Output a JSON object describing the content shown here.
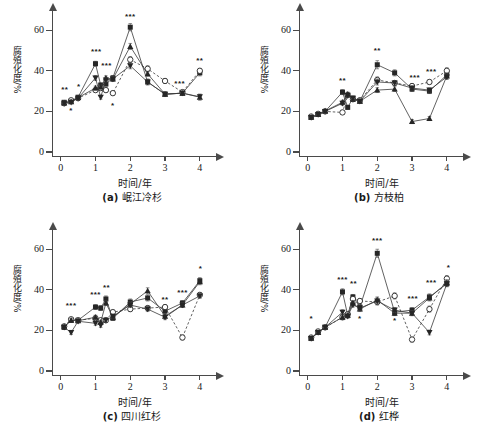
{
  "figure": {
    "panel_count": 4,
    "axis_color": "#4a4a4a"
  },
  "chart_data": [
    {
      "type": "line",
      "panel_id": "(a)",
      "title": "(a) 岷江冷杉",
      "caption_id": "(a)",
      "caption_text": "岷江冷杉",
      "xlabel": "时间/年",
      "ylabel": "腐殖化度/%",
      "xlim": [
        -0.25,
        4.35
      ],
      "ylim": [
        0,
        68
      ],
      "xticks": [
        0,
        1,
        2,
        3,
        4
      ],
      "yticks": [
        0,
        20,
        40,
        60
      ],
      "grid": false,
      "legend_position": "none",
      "x": [
        0.1,
        0.3,
        0.5,
        1.0,
        1.15,
        1.3,
        1.5,
        2.0,
        2.5,
        3.0,
        3.5,
        4.0
      ],
      "series": [
        {
          "name": "filled-square",
          "marker": "square-filled",
          "line": "solid",
          "values": [
            24.5,
            25.0,
            27.0,
            43.5,
            33.0,
            33.5,
            36.5,
            61.5,
            34.5,
            28.5,
            29.0,
            39.0
          ],
          "errors": [
            0.8,
            0.8,
            0.8,
            1.2,
            1.0,
            1.0,
            1.2,
            1.8,
            1.5,
            1.0,
            1.0,
            1.5
          ]
        },
        {
          "name": "open-circle",
          "marker": "circle-open",
          "line": "dashed",
          "values": [
            24.0,
            25.5,
            26.5,
            30.5,
            31.5,
            30.5,
            29.0,
            45.5,
            41.0,
            35.0,
            29.5,
            40.0
          ],
          "errors": [
            0.8,
            0.8,
            0.8,
            1.0,
            1.0,
            1.0,
            1.0,
            1.5,
            1.5,
            1.2,
            1.0,
            1.2
          ]
        },
        {
          "name": "filled-triangle-up",
          "marker": "triangle-filled",
          "line": "solid",
          "values": [
            24.2,
            24.8,
            26.8,
            31.5,
            32.0,
            36.5,
            36.0,
            52.0,
            38.5,
            28.5,
            29.0,
            27.0
          ],
          "errors": [
            0.8,
            0.8,
            0.8,
            1.0,
            1.0,
            1.0,
            1.2,
            1.5,
            1.2,
            1.0,
            1.0,
            1.5
          ]
        },
        {
          "name": "filled-triangle-down",
          "marker": "triangle-down-filled",
          "line": "solid",
          "values": [
            24.0,
            24.5,
            26.5,
            36.5,
            27.0,
            35.5,
            36.0,
            42.5,
            34.5,
            28.5,
            29.0,
            27.2
          ],
          "errors": [
            0.8,
            0.8,
            0.8,
            1.2,
            1.0,
            1.0,
            1.2,
            1.5,
            1.2,
            1.0,
            1.0,
            1.2
          ]
        }
      ],
      "annotations": [
        {
          "text": "**",
          "x": 0.12,
          "y": 30.5
        },
        {
          "text": "*",
          "x": 0.3,
          "y": 20.0
        },
        {
          "text": "*",
          "x": 0.52,
          "y": 32.0
        },
        {
          "text": "***",
          "x": 1.02,
          "y": 49.5
        },
        {
          "text": "***",
          "x": 1.32,
          "y": 42.5
        },
        {
          "text": "*",
          "x": 1.5,
          "y": 22.5
        },
        {
          "text": "***",
          "x": 2.0,
          "y": 66.5
        },
        {
          "text": "***",
          "x": 3.42,
          "y": 33.5
        },
        {
          "text": "**",
          "x": 4.0,
          "y": 45.0
        }
      ]
    },
    {
      "type": "line",
      "panel_id": "(b)",
      "title": "(b) 方枝柏",
      "caption_id": "(b)",
      "caption_text": "方枝柏",
      "xlabel": "时间/年",
      "ylabel": "腐殖化度/%",
      "xlim": [
        -0.25,
        4.35
      ],
      "ylim": [
        0,
        68
      ],
      "xticks": [
        0,
        1,
        2,
        3,
        4
      ],
      "yticks": [
        0,
        20,
        40,
        60
      ],
      "grid": false,
      "legend_position": "none",
      "x": [
        0.1,
        0.3,
        0.5,
        1.0,
        1.15,
        1.3,
        1.5,
        2.0,
        2.5,
        3.0,
        3.5,
        4.0
      ],
      "series": [
        {
          "name": "filled-square",
          "marker": "square-filled",
          "line": "solid",
          "values": [
            17.0,
            18.5,
            20.0,
            29.5,
            22.0,
            26.5,
            25.0,
            43.0,
            39.0,
            31.0,
            30.0,
            38.0
          ],
          "errors": [
            0.8,
            0.8,
            0.8,
            1.2,
            1.0,
            1.0,
            1.0,
            2.0,
            1.5,
            1.2,
            1.2,
            1.5
          ]
        },
        {
          "name": "open-circle",
          "marker": "circle-open",
          "line": "dashed",
          "values": [
            17.5,
            18.8,
            20.0,
            19.5,
            28.0,
            26.0,
            25.5,
            35.5,
            34.0,
            32.5,
            34.5,
            40.0
          ],
          "errors": [
            0.8,
            0.8,
            0.8,
            1.0,
            1.0,
            1.0,
            1.0,
            1.5,
            1.2,
            1.2,
            1.2,
            1.5
          ]
        },
        {
          "name": "filled-triangle-up",
          "marker": "triangle-filled",
          "line": "solid",
          "values": [
            17.2,
            18.5,
            20.2,
            24.5,
            28.5,
            26.0,
            25.0,
            30.5,
            31.0,
            15.0,
            16.5,
            37.5
          ],
          "errors": [
            0.8,
            0.8,
            0.8,
            1.0,
            1.0,
            1.0,
            1.0,
            1.2,
            1.2,
            1.0,
            1.0,
            1.5
          ]
        },
        {
          "name": "filled-triangle-down",
          "marker": "triangle-down-filled",
          "line": "solid",
          "values": [
            17.0,
            18.5,
            20.0,
            24.0,
            28.0,
            26.5,
            25.0,
            34.5,
            34.0,
            31.5,
            30.5,
            37.0
          ],
          "errors": [
            0.8,
            0.8,
            0.8,
            1.0,
            1.0,
            1.0,
            1.0,
            1.5,
            1.2,
            1.0,
            1.0,
            1.2
          ]
        }
      ],
      "annotations": [
        {
          "text": "**",
          "x": 1.0,
          "y": 35.0
        },
        {
          "text": "**",
          "x": 2.0,
          "y": 50.0
        },
        {
          "text": "***",
          "x": 3.08,
          "y": 36.5
        },
        {
          "text": "***",
          "x": 3.55,
          "y": 39.5
        }
      ]
    },
    {
      "type": "line",
      "panel_id": "(c)",
      "title": "(c) 四川红杉",
      "caption_id": "(c)",
      "caption_text": "四川红杉",
      "xlabel": "时间/年",
      "ylabel": "腐殖化度/%",
      "xlim": [
        -0.25,
        4.35
      ],
      "ylim": [
        0,
        68
      ],
      "xticks": [
        0,
        1,
        2,
        3,
        4
      ],
      "yticks": [
        0,
        20,
        40,
        60
      ],
      "grid": false,
      "legend_position": "none",
      "x": [
        0.1,
        0.3,
        0.5,
        1.0,
        1.15,
        1.3,
        1.5,
        2.0,
        2.5,
        3.0,
        3.5,
        4.0
      ],
      "series": [
        {
          "name": "filled-square",
          "marker": "square-filled",
          "line": "solid",
          "values": [
            21.5,
            25.0,
            25.0,
            31.5,
            31.0,
            35.5,
            26.0,
            34.0,
            36.0,
            29.5,
            33.5,
            44.5
          ],
          "errors": [
            0.8,
            0.8,
            0.8,
            1.2,
            1.2,
            1.5,
            1.0,
            1.5,
            1.5,
            1.5,
            1.2,
            1.5
          ]
        },
        {
          "name": "open-circle",
          "marker": "circle-open",
          "line": "dashed",
          "values": [
            22.0,
            25.5,
            25.0,
            26.0,
            25.0,
            25.0,
            29.0,
            30.5,
            31.0,
            31.5,
            16.5,
            37.5
          ],
          "errors": [
            0.8,
            0.8,
            0.8,
            1.0,
            1.0,
            1.0,
            1.0,
            1.2,
            1.2,
            1.2,
            1.2,
            1.2
          ]
        },
        {
          "name": "filled-triangle-up",
          "marker": "triangle-filled",
          "line": "solid",
          "values": [
            21.8,
            25.0,
            24.8,
            26.5,
            24.0,
            33.5,
            26.5,
            33.0,
            39.5,
            27.0,
            32.5,
            44.0
          ],
          "errors": [
            0.8,
            0.8,
            0.8,
            1.0,
            1.0,
            1.2,
            1.0,
            1.2,
            1.5,
            1.2,
            1.2,
            1.5
          ]
        },
        {
          "name": "filled-triangle-down",
          "marker": "triangle-down-filled",
          "line": "solid",
          "values": [
            21.5,
            19.0,
            24.5,
            23.5,
            22.5,
            25.0,
            27.0,
            32.5,
            30.5,
            26.5,
            32.5,
            37.0
          ],
          "errors": [
            0.8,
            1.0,
            0.8,
            1.0,
            1.0,
            1.0,
            1.0,
            1.2,
            1.2,
            1.2,
            1.2,
            1.2
          ]
        }
      ],
      "annotations": [
        {
          "text": "***",
          "x": 0.3,
          "y": 32.0
        },
        {
          "text": "***",
          "x": 1.0,
          "y": 37.5
        },
        {
          "text": "**",
          "x": 1.32,
          "y": 41.0
        },
        {
          "text": "**",
          "x": 3.0,
          "y": 35.0
        },
        {
          "text": "***",
          "x": 3.5,
          "y": 38.5
        },
        {
          "text": "*",
          "x": 4.02,
          "y": 50.5
        }
      ]
    },
    {
      "type": "line",
      "panel_id": "(d)",
      "title": "(d) 红桦",
      "caption_id": "(d)",
      "caption_text": "红桦",
      "xlabel": "时间/年",
      "ylabel": "腐殖化度/%",
      "xlim": [
        -0.25,
        4.35
      ],
      "ylim": [
        0,
        68
      ],
      "xticks": [
        0,
        1,
        2,
        3,
        4
      ],
      "yticks": [
        0,
        20,
        40,
        60
      ],
      "grid": false,
      "legend_position": "none",
      "x": [
        0.1,
        0.3,
        0.5,
        1.0,
        1.15,
        1.3,
        1.5,
        2.0,
        2.5,
        3.0,
        3.5,
        4.0
      ],
      "series": [
        {
          "name": "filled-square",
          "marker": "square-filled",
          "line": "solid",
          "values": [
            16.0,
            19.0,
            21.5,
            39.0,
            27.5,
            36.5,
            31.5,
            58.0,
            29.0,
            30.0,
            36.5,
            43.0
          ],
          "errors": [
            0.8,
            0.8,
            0.8,
            1.5,
            1.2,
            1.2,
            1.2,
            2.0,
            1.5,
            1.2,
            1.5,
            1.5
          ]
        },
        {
          "name": "open-circle",
          "marker": "circle-open",
          "line": "dashed",
          "values": [
            16.5,
            19.5,
            21.5,
            26.5,
            28.0,
            35.5,
            34.5,
            34.0,
            37.0,
            15.5,
            30.5,
            45.5
          ],
          "errors": [
            0.8,
            0.8,
            0.8,
            1.2,
            1.0,
            1.2,
            1.2,
            1.5,
            1.5,
            1.2,
            1.5,
            1.5
          ]
        },
        {
          "name": "filled-triangle-up",
          "marker": "triangle-filled",
          "line": "solid",
          "values": [
            16.2,
            19.0,
            21.5,
            26.5,
            27.5,
            33.5,
            30.5,
            35.0,
            28.5,
            28.5,
            36.0,
            43.5
          ],
          "errors": [
            0.8,
            0.8,
            0.8,
            1.2,
            1.0,
            1.2,
            1.2,
            1.5,
            1.2,
            1.2,
            1.5,
            1.5
          ]
        },
        {
          "name": "filled-triangle-down",
          "marker": "triangle-down-filled",
          "line": "solid",
          "values": [
            16.0,
            19.0,
            21.5,
            29.0,
            27.0,
            32.5,
            31.0,
            34.5,
            30.0,
            28.5,
            19.0,
            43.0
          ],
          "errors": [
            0.8,
            0.8,
            0.8,
            1.2,
            1.0,
            1.0,
            1.2,
            1.5,
            1.2,
            1.2,
            1.2,
            1.2
          ]
        }
      ],
      "annotations": [
        {
          "text": "*",
          "x": 0.1,
          "y": 25.5
        },
        {
          "text": "***",
          "x": 1.0,
          "y": 45.0
        },
        {
          "text": "**",
          "x": 1.32,
          "y": 43.0
        },
        {
          "text": "*",
          "x": 1.5,
          "y": 25.5
        },
        {
          "text": "***",
          "x": 2.0,
          "y": 64.0
        },
        {
          "text": "*",
          "x": 2.5,
          "y": 24.5
        },
        {
          "text": "***",
          "x": 3.02,
          "y": 35.5
        },
        {
          "text": "***",
          "x": 3.55,
          "y": 43.5
        },
        {
          "text": "*",
          "x": 4.05,
          "y": 51.0
        }
      ]
    }
  ]
}
